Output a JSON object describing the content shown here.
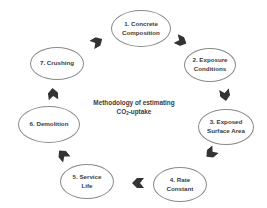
{
  "diagram": {
    "title_line1": "Methodology of estimating",
    "title_line2_prefix": "CO",
    "title_line2_sub": "2",
    "title_line2_suffix": "-uptake",
    "colors": {
      "ellipse_border": "#8a8a8a",
      "text": "#3a3a3a",
      "arrow": "#333333",
      "background": "#ffffff"
    },
    "steps": [
      {
        "number": "1.",
        "line1": "1. Concrete",
        "line2": "Composition"
      },
      {
        "number": "2.",
        "line1": "2. Exposure",
        "line2": "Conditions"
      },
      {
        "number": "3.",
        "line1": "3. Exposed",
        "line2": "Surface Area"
      },
      {
        "number": "4.",
        "line1": "4. Rate",
        "line2": "Constant"
      },
      {
        "number": "5.",
        "line1": "5. Service",
        "line2": "Life"
      },
      {
        "number": "6.",
        "line1": "6. Demolition",
        "line2": ""
      },
      {
        "number": "7.",
        "line1": "7. Crushing",
        "line2": ""
      }
    ],
    "arrows": [
      {
        "from": "1",
        "to": "2",
        "icon": "chevron-arrow-icon"
      },
      {
        "from": "2",
        "to": "3",
        "icon": "chevron-arrow-icon"
      },
      {
        "from": "3",
        "to": "4",
        "icon": "chevron-arrow-icon"
      },
      {
        "from": "4",
        "to": "5",
        "icon": "chevron-arrow-icon"
      },
      {
        "from": "5",
        "to": "6",
        "icon": "chevron-arrow-icon"
      },
      {
        "from": "6",
        "to": "7",
        "icon": "chevron-arrow-icon"
      },
      {
        "from": "7",
        "to": "1",
        "icon": "chevron-arrow-icon"
      }
    ]
  }
}
